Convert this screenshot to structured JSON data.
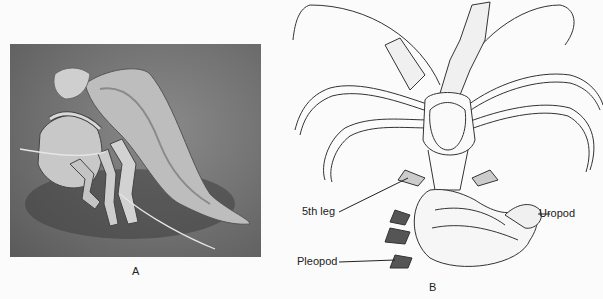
{
  "figure": {
    "panels": [
      {
        "id": "A",
        "caption": "A",
        "type": "photograph",
        "subject": "hermit crab in gastropod shell"
      },
      {
        "id": "B",
        "caption": "B",
        "type": "line-drawing",
        "subject": "hermit crab removed from shell, dorsal view",
        "labels": [
          {
            "text": "5th leg"
          },
          {
            "text": "Pleopod"
          },
          {
            "text": "Uropod"
          }
        ]
      }
    ]
  }
}
